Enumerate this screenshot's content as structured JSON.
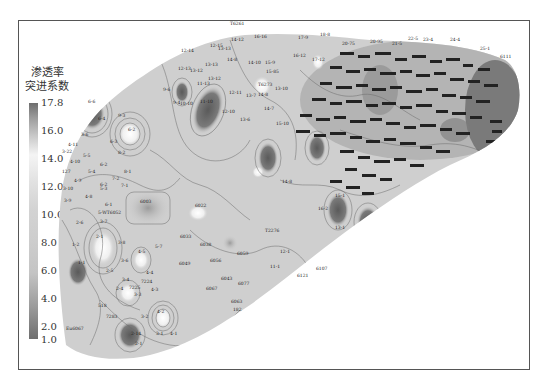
{
  "legend": {
    "title_line1": "渗透率",
    "title_line2": "突进系数",
    "ticks": [
      "17.8",
      "16.0",
      "14.0",
      "12.0",
      "10.0",
      "8.0",
      "6.0",
      "4.0",
      "2.0",
      "1.0"
    ],
    "color_max": "#6e6e6e",
    "color_light": "#f4f4f4",
    "color_min": "#6e6e6e"
  },
  "map": {
    "fill_color": "#cfcfcf",
    "contour_color": "#6a6a6a",
    "well_labels": [
      {
        "t": "T6261",
        "x": 230,
        "y": 25
      },
      {
        "t": "14-12",
        "x": 231,
        "y": 41
      },
      {
        "t": "16-16",
        "x": 254,
        "y": 38
      },
      {
        "t": "17-9",
        "x": 298,
        "y": 39
      },
      {
        "t": "18-8",
        "x": 320,
        "y": 36
      },
      {
        "t": "12-15",
        "x": 210,
        "y": 47
      },
      {
        "t": "12-14",
        "x": 181,
        "y": 52
      },
      {
        "t": "13-13",
        "x": 218,
        "y": 50
      },
      {
        "t": "16-12",
        "x": 293,
        "y": 57
      },
      {
        "t": "17-12",
        "x": 312,
        "y": 61
      },
      {
        "t": "14-8",
        "x": 227,
        "y": 61
      },
      {
        "t": "13-13",
        "x": 205,
        "y": 66
      },
      {
        "t": "13-12",
        "x": 190,
        "y": 72
      },
      {
        "t": "14-10",
        "x": 248,
        "y": 64
      },
      {
        "t": "15-9",
        "x": 265,
        "y": 64
      },
      {
        "t": "15-85",
        "x": 266,
        "y": 73
      },
      {
        "t": "13-12",
        "x": 208,
        "y": 80
      },
      {
        "t": "12-13",
        "x": 178,
        "y": 70
      },
      {
        "t": "11-13",
        "x": 197,
        "y": 85
      },
      {
        "t": "12-11",
        "x": 229,
        "y": 94
      },
      {
        "t": "13-7",
        "x": 246,
        "y": 97
      },
      {
        "t": "14-8",
        "x": 258,
        "y": 96
      },
      {
        "t": "13-10",
        "x": 275,
        "y": 90
      },
      {
        "t": "T6273",
        "x": 258,
        "y": 86
      },
      {
        "t": "9-6",
        "x": 163,
        "y": 91
      },
      {
        "t": "9-4",
        "x": 173,
        "y": 104
      },
      {
        "t": "10-10",
        "x": 180,
        "y": 105
      },
      {
        "t": "11-10",
        "x": 200,
        "y": 103
      },
      {
        "t": "12-10",
        "x": 222,
        "y": 113
      },
      {
        "t": "13-6",
        "x": 240,
        "y": 121
      },
      {
        "t": "14-7",
        "x": 264,
        "y": 110
      },
      {
        "t": "15-10",
        "x": 276,
        "y": 125
      },
      {
        "t": "20-75",
        "x": 342,
        "y": 45
      },
      {
        "t": "20-95",
        "x": 370,
        "y": 43
      },
      {
        "t": "21-5",
        "x": 392,
        "y": 45
      },
      {
        "t": "22-5",
        "x": 408,
        "y": 40
      },
      {
        "t": "23-4",
        "x": 423,
        "y": 41
      },
      {
        "t": "24-4",
        "x": 450,
        "y": 41
      },
      {
        "t": "25-1",
        "x": 480,
        "y": 50
      },
      {
        "t": "6111",
        "x": 500,
        "y": 58
      },
      {
        "t": "6-6",
        "x": 88,
        "y": 103
      },
      {
        "t": "6-4",
        "x": 98,
        "y": 120
      },
      {
        "t": "9-3",
        "x": 118,
        "y": 117
      },
      {
        "t": "6-2",
        "x": 128,
        "y": 131
      },
      {
        "t": "6-3",
        "x": 110,
        "y": 143
      },
      {
        "t": "8-2",
        "x": 118,
        "y": 154
      },
      {
        "t": "3-6",
        "x": 81,
        "y": 136
      },
      {
        "t": "4-11",
        "x": 68,
        "y": 146
      },
      {
        "t": "3-22",
        "x": 62,
        "y": 153
      },
      {
        "t": "5-5",
        "x": 83,
        "y": 157
      },
      {
        "t": "4-10",
        "x": 70,
        "y": 163
      },
      {
        "t": "6-2",
        "x": 100,
        "y": 166
      },
      {
        "t": "5-4",
        "x": 88,
        "y": 173
      },
      {
        "t": "8-1",
        "x": 124,
        "y": 173
      },
      {
        "t": "127",
        "x": 62,
        "y": 173
      },
      {
        "t": "4-9",
        "x": 74,
        "y": 182
      },
      {
        "t": "3-10",
        "x": 63,
        "y": 190
      },
      {
        "t": "5-3",
        "x": 100,
        "y": 190
      },
      {
        "t": "4-8",
        "x": 85,
        "y": 198
      },
      {
        "t": "3-9",
        "x": 64,
        "y": 202
      },
      {
        "t": "7-2",
        "x": 112,
        "y": 180
      },
      {
        "t": "6-2",
        "x": 100,
        "y": 186
      },
      {
        "t": "7-1",
        "x": 121,
        "y": 187
      },
      {
        "t": "6-1",
        "x": 105,
        "y": 206
      },
      {
        "t": "5-WT6052",
        "x": 98,
        "y": 214
      },
      {
        "t": "6003",
        "x": 140,
        "y": 203
      },
      {
        "t": "6022",
        "x": 195,
        "y": 207
      },
      {
        "t": "2-6",
        "x": 76,
        "y": 224
      },
      {
        "t": "3-7",
        "x": 100,
        "y": 223
      },
      {
        "t": "2-1",
        "x": 96,
        "y": 238
      },
      {
        "t": "1-2",
        "x": 72,
        "y": 246
      },
      {
        "t": "3-8",
        "x": 118,
        "y": 244
      },
      {
        "t": "4-5",
        "x": 138,
        "y": 253
      },
      {
        "t": "5-7",
        "x": 155,
        "y": 248
      },
      {
        "t": "1-1",
        "x": 78,
        "y": 264
      },
      {
        "t": "3-6",
        "x": 121,
        "y": 262
      },
      {
        "t": "2-5",
        "x": 106,
        "y": 272
      },
      {
        "t": "4-4",
        "x": 146,
        "y": 274
      },
      {
        "t": "3-4",
        "x": 122,
        "y": 281
      },
      {
        "t": "7224",
        "x": 141,
        "y": 283
      },
      {
        "t": "7225",
        "x": 129,
        "y": 289
      },
      {
        "t": "2-4",
        "x": 116,
        "y": 290
      },
      {
        "t": "3-3",
        "x": 134,
        "y": 296
      },
      {
        "t": "4-3",
        "x": 151,
        "y": 291
      },
      {
        "t": "518",
        "x": 98,
        "y": 307
      },
      {
        "t": "7283",
        "x": 106,
        "y": 318
      },
      {
        "t": "4-2",
        "x": 157,
        "y": 313
      },
      {
        "t": "3-2",
        "x": 141,
        "y": 318
      },
      {
        "t": "2-14",
        "x": 131,
        "y": 335
      },
      {
        "t": "2-1",
        "x": 135,
        "y": 345
      },
      {
        "t": "3-1",
        "x": 156,
        "y": 335
      },
      {
        "t": "4-1",
        "x": 170,
        "y": 335
      },
      {
        "t": "Eu6067",
        "x": 66,
        "y": 330
      },
      {
        "t": "6033",
        "x": 180,
        "y": 238
      },
      {
        "t": "6038",
        "x": 200,
        "y": 246
      },
      {
        "t": "6049",
        "x": 179,
        "y": 265
      },
      {
        "t": "6056",
        "x": 210,
        "y": 262
      },
      {
        "t": "6059",
        "x": 237,
        "y": 255
      },
      {
        "t": "6043",
        "x": 221,
        "y": 280
      },
      {
        "t": "6067",
        "x": 206,
        "y": 290
      },
      {
        "t": "6063",
        "x": 231,
        "y": 303
      },
      {
        "t": "182",
        "x": 233,
        "y": 311
      },
      {
        "t": "6077",
        "x": 238,
        "y": 285
      },
      {
        "t": "T2276",
        "x": 265,
        "y": 232
      },
      {
        "t": "12-1",
        "x": 280,
        "y": 253
      },
      {
        "t": "11-1",
        "x": 270,
        "y": 268
      },
      {
        "t": "14-8",
        "x": 282,
        "y": 183
      },
      {
        "t": "15-1",
        "x": 335,
        "y": 197
      },
      {
        "t": "16-2",
        "x": 318,
        "y": 210
      },
      {
        "t": "13-1",
        "x": 335,
        "y": 229
      },
      {
        "t": "6107",
        "x": 316,
        "y": 270
      },
      {
        "t": "6121",
        "x": 297,
        "y": 277
      }
    ]
  }
}
